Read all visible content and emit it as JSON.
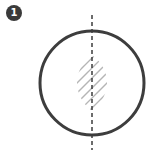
{
  "step_badge": {
    "label": "1"
  },
  "colors": {
    "stroke": "#3d3d3d",
    "hatch": "#b5b5b5",
    "badge": "#3a3a3a"
  }
}
